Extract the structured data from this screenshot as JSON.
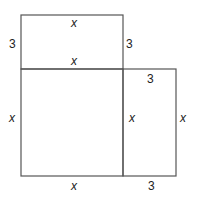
{
  "diagram": {
    "regions": [
      {
        "name": "top-rectangle",
        "width": "x",
        "height": "3"
      },
      {
        "name": "main-square",
        "width": "x",
        "height": "x"
      },
      {
        "name": "right-rectangle",
        "width": "3",
        "height": "x"
      }
    ],
    "labels": {
      "top_rect_top": "x",
      "top_rect_left": "3",
      "top_rect_right": "3",
      "top_rect_bottom": "x",
      "right_rect_top": "3",
      "square_left": "x",
      "square_right": "x",
      "right_rect_right": "x",
      "square_bottom": "x",
      "right_rect_bottom": "3"
    },
    "colors": {
      "stroke": "#555555",
      "text": "#222222",
      "background": "#ffffff"
    }
  }
}
